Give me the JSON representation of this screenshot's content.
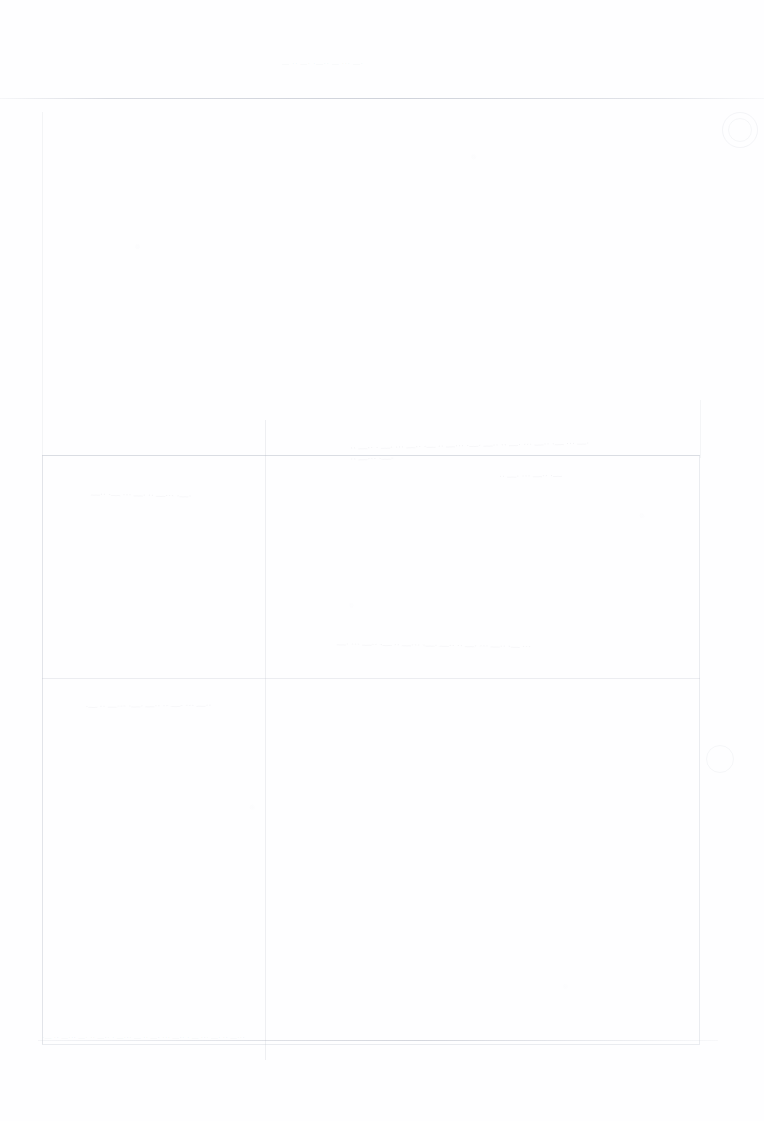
{
  "document": {
    "legibility": "illegible",
    "condition": "severely faded scanned page; ink nearly bleached out",
    "header_line": "— ·· —· ·—·· — ··· —·",
    "footer_line": "·— ·· —··· —· ·· —·· · —··· — ·· —· ··· —·· · — ··· —· ·· —···",
    "page_number": "",
    "ink_residue": {
      "center_upper": "·· —·· · —· ··· —·· ·— ·· —··· ·—· —·· ·· —· ··· —·· ·— ··· —· ·· —··· ·—·",
      "center_lower": "—· ··· —·· ·— ·· —··· ·—· —·· ·· —· ··· —·· ·— ···",
      "left_lower": "·— ·· —··· ·—· —·· ·· —· ··· —··",
      "left_upper": "—·· ·— ··· —· ·· —··· ·—·",
      "right_upper": "·· —· ··· —·· ·—"
    }
  }
}
